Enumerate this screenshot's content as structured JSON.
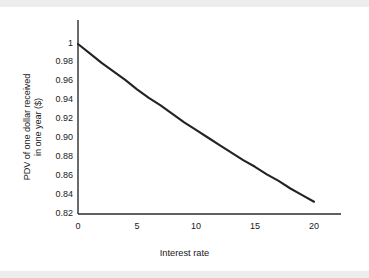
{
  "figure": {
    "background_color": "#ffffff",
    "band_color": "#ededed",
    "line_color": "#232323"
  },
  "chart_data": {
    "type": "line",
    "title": "",
    "subtitle": "",
    "xlabel": "Interest rate",
    "ylabel_line1": "PDV of one dollar received",
    "ylabel_line2": "in one year ($)",
    "xlim": [
      0,
      20
    ],
    "ylim": [
      0.82,
      1.0
    ],
    "xticks": [
      0,
      5,
      10,
      15,
      20
    ],
    "xticklabels": [
      "0",
      "5",
      "10",
      "15",
      "20"
    ],
    "yticks": [
      0.82,
      0.84,
      0.86,
      0.88,
      0.9,
      0.92,
      0.94,
      0.96,
      0.98,
      1.0
    ],
    "yticklabels": [
      "0.82",
      "0.84",
      "0.86",
      "0.88",
      "0.90",
      "0.92",
      "0.94",
      "0.96",
      "0.98",
      "1"
    ],
    "grid": false,
    "legend": null,
    "legend_position": "none",
    "annotations": [],
    "series": [
      {
        "name": "PDV = 1/(1+r)",
        "x": [
          0,
          1,
          2,
          3,
          4,
          5,
          6,
          7,
          8,
          9,
          10,
          11,
          12,
          13,
          14,
          15,
          16,
          17,
          18,
          19,
          20
        ],
        "y": [
          1.0,
          0.99,
          0.98,
          0.971,
          0.962,
          0.952,
          0.943,
          0.935,
          0.926,
          0.917,
          0.909,
          0.901,
          0.893,
          0.885,
          0.877,
          0.87,
          0.862,
          0.855,
          0.847,
          0.84,
          0.833
        ]
      }
    ]
  }
}
